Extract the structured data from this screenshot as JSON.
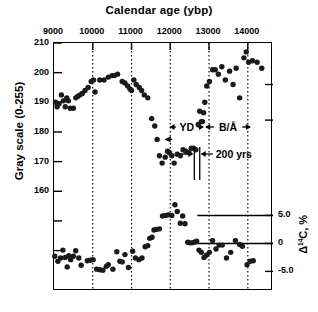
{
  "figure": {
    "top_axis_title": "Calendar age (ybp)",
    "left_axis_title": "Gray scale (0-255)",
    "right_axis_title_prefix": "Δ",
    "right_axis_title_sup": "14",
    "right_axis_title_suffix": "C, %"
  },
  "annotations": {
    "yd": "YD",
    "ba": "B/Å",
    "duration": "200 yrs"
  },
  "chart_data": {
    "type": "scatter",
    "title": "Calendar age (ybp)",
    "xlabel": "Calendar age (ybp)",
    "xlim": [
      9000,
      14650
    ],
    "x_ticks": [
      9000,
      10000,
      11000,
      12000,
      13000,
      14000
    ],
    "x_tick_labels": [
      "9000",
      "10000",
      "11000",
      "12000",
      "13000",
      "14000"
    ],
    "grid": "vertical dotted lines at 10000, 11000, 12000, 13000, 14000",
    "x_axis_position": "top",
    "panels": [
      {
        "name": "gray-scale-panel",
        "ylabel": "Gray scale (0-255)",
        "ylim": [
          152,
          210
        ],
        "y_ticks": [
          210,
          200,
          190,
          180,
          170,
          160
        ],
        "y_tick_labels": [
          "210",
          "200",
          "190",
          "180",
          "170",
          "160"
        ],
        "series": [
          {
            "name": "gray-scale",
            "points": [
              [
                9040,
                190
              ],
              [
                9080,
                188.5
              ],
              [
                9130,
                189.5
              ],
              [
                9190,
                192.5
              ],
              [
                9240,
                190.5
              ],
              [
                9290,
                188.5
              ],
              [
                9330,
                191.5
              ],
              [
                9370,
                190.5
              ],
              [
                9420,
                188
              ],
              [
                9500,
                188
              ],
              [
                9560,
                191.5
              ],
              [
                9610,
                192
              ],
              [
                9670,
                192.5
              ],
              [
                9730,
                193
              ],
              [
                9800,
                194
              ],
              [
                9880,
                195
              ],
              [
                9960,
                197
              ],
              [
                10020,
                197.5
              ],
              [
                10060,
                193.5
              ],
              [
                10180,
                197.5
              ],
              [
                10290,
                197.5
              ],
              [
                10400,
                198.5
              ],
              [
                10500,
                199
              ],
              [
                10560,
                199
              ],
              [
                10640,
                199.5
              ],
              [
                10760,
                197
              ],
              [
                10830,
                196.5
              ],
              [
                10900,
                195.5
              ],
              [
                10960,
                194.5
              ],
              [
                11000,
                194
              ],
              [
                11060,
                197.5
              ],
              [
                11120,
                196
              ],
              [
                11200,
                195
              ],
              [
                11260,
                194
              ],
              [
                11330,
                192.5
              ],
              [
                11420,
                191.5
              ],
              [
                11520,
                184.5
              ],
              [
                11600,
                182
              ],
              [
                11660,
                177.5
              ],
              [
                11720,
                172
              ],
              [
                11790,
                169.5
              ],
              [
                11870,
                171.5
              ],
              [
                11930,
                173.5
              ],
              [
                11980,
                173
              ],
              [
                12040,
                172
              ],
              [
                12100,
                169.5
              ],
              [
                12180,
                172.5
              ],
              [
                12260,
                172
              ],
              [
                12330,
                174
              ],
              [
                12400,
                173.5
              ],
              [
                12480,
                173
              ],
              [
                12540,
                174.5
              ],
              [
                12600,
                174.5
              ],
              [
                12660,
                174
              ],
              [
                12720,
                182.5
              ],
              [
                12760,
                187
              ],
              [
                12800,
                183.5
              ],
              [
                12830,
                183.5
              ],
              [
                12860,
                186.5
              ],
              [
                12890,
                190
              ],
              [
                12940,
                195.5
              ],
              [
                13010,
                197
              ],
              [
                13090,
                201
              ],
              [
                13160,
                201
              ],
              [
                13240,
                199.5
              ],
              [
                13330,
                202
              ],
              [
                13420,
                197.5
              ],
              [
                13530,
                200.5
              ],
              [
                13620,
                196
              ],
              [
                13700,
                201.5
              ],
              [
                13790,
                191.5
              ],
              [
                13900,
                205
              ],
              [
                13960,
                207
              ],
              [
                14020,
                203.5
              ],
              [
                14120,
                204
              ],
              [
                14240,
                203.5
              ],
              [
                14360,
                201.5
              ]
            ]
          }
        ],
        "reference_markers": [
          {
            "type": "vertical-bar",
            "x": 12620
          },
          {
            "type": "vertical-bar",
            "x": 12760
          },
          {
            "type": "span-label",
            "label": "200 yrs"
          }
        ],
        "interval_labels": [
          {
            "label": "YD",
            "from": 11980,
            "to": 12870
          },
          {
            "label": "B/Å",
            "from": 12900,
            "to": 14080
          }
        ]
      },
      {
        "name": "delta-c14-panel",
        "ylabel": "Δ14C, %",
        "ylim": [
          -8.5,
          9.0
        ],
        "y_ticks": [
          5.0,
          0,
          -5.0
        ],
        "y_tick_labels": [
          "5.0",
          "0",
          "-5.0"
        ],
        "reference_lines": [
          {
            "y": 5.0,
            "from_x": 12700,
            "to_x": 14650
          },
          {
            "y": 0.0,
            "from_x": 12530,
            "to_x": 14650
          }
        ],
        "series": [
          {
            "name": "delta-c14",
            "points": [
              [
                9020,
                -2.3
              ],
              [
                9100,
                -3.2
              ],
              [
                9170,
                -2.6
              ],
              [
                9230,
                -1.2
              ],
              [
                9290,
                -2.5
              ],
              [
                9340,
                -4.2
              ],
              [
                9380,
                -2.2
              ],
              [
                9430,
                -2.9
              ],
              [
                9500,
                -2.3
              ],
              [
                9560,
                -1.3
              ],
              [
                9640,
                -2.6
              ],
              [
                9700,
                -3.9
              ],
              [
                9860,
                -3.1
              ],
              [
                9930,
                -3.0
              ],
              [
                10010,
                -2.9
              ],
              [
                10100,
                -4.6
              ],
              [
                10180,
                -4.7
              ],
              [
                10260,
                -4.8
              ],
              [
                10350,
                -4.1
              ],
              [
                10400,
                -3.8
              ],
              [
                10520,
                -4.6
              ],
              [
                10620,
                -1.5
              ],
              [
                10700,
                -3.2
              ],
              [
                10760,
                -3.3
              ],
              [
                10830,
                -2.0
              ],
              [
                10920,
                -4.3
              ],
              [
                11030,
                -1.4
              ],
              [
                11100,
                -2.6
              ],
              [
                11190,
                -2.9
              ],
              [
                11270,
                -2.6
              ],
              [
                11350,
                -0.6
              ],
              [
                11420,
                -0.4
              ],
              [
                11470,
                0.9
              ],
              [
                11530,
                1.1
              ],
              [
                11580,
                2.4
              ],
              [
                11640,
                2.5
              ],
              [
                11720,
                2.6
              ],
              [
                11800,
                4.9
              ],
              [
                11880,
                5.0
              ],
              [
                11950,
                5.1
              ],
              [
                12040,
                5.0
              ],
              [
                12120,
                6.9
              ],
              [
                12180,
                5.7
              ],
              [
                12260,
                3.6
              ],
              [
                12320,
                4.9
              ],
              [
                12380,
                3.5
              ],
              [
                12450,
                0.2
              ],
              [
                12500,
                0.1
              ],
              [
                12560,
                0.1
              ],
              [
                12620,
                0.2
              ],
              [
                12680,
                0.4
              ],
              [
                12740,
                -1.2
              ],
              [
                12800,
                -1.6
              ],
              [
                12870,
                -2.5
              ],
              [
                12930,
                -2.1
              ],
              [
                13010,
                -1.6
              ],
              [
                13090,
                0.5
              ],
              [
                13180,
                -1.0
              ],
              [
                13260,
                -0.3
              ],
              [
                13340,
                -0.3
              ],
              [
                13450,
                -2.6
              ],
              [
                13560,
                -1.6
              ],
              [
                13680,
                0.5
              ],
              [
                13790,
                -0.2
              ],
              [
                13860,
                -0.5
              ],
              [
                13980,
                -3.8
              ],
              [
                14060,
                -3.2
              ],
              [
                14140,
                -3.1
              ]
            ]
          }
        ]
      }
    ]
  }
}
